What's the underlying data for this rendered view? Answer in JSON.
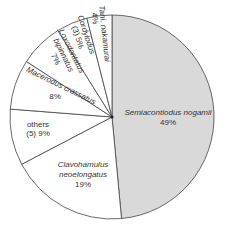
{
  "chart_data": {
    "type": "pie",
    "title": "",
    "start_angle_deg": 0,
    "direction": "clockwise",
    "center": [
      112,
      117
    ],
    "radius": 102,
    "slices": [
      {
        "label": "Semiacontiodus nogamii",
        "value": 49,
        "pct_label": "49%",
        "italic": true,
        "fill": "#d9d9d9"
      },
      {
        "label": "Clavohamulus neoelongatus",
        "value": 19,
        "pct_label": "19%",
        "italic": true,
        "fill": "#ffffff"
      },
      {
        "label": "others (5)",
        "value": 9,
        "pct_label": "9%",
        "italic": false,
        "fill": "#ffffff"
      },
      {
        "label": "Macerodus crassatus",
        "value": 8,
        "pct_label": "8%",
        "italic": true,
        "fill": "#ffffff"
      },
      {
        "label": "Loxodontatus bipinnatus",
        "value": 7,
        "pct_label": "7%",
        "italic": true,
        "fill": "#ffffff"
      },
      {
        "label": "Cordylodus (3)",
        "value": 5,
        "pct_label": "5%",
        "italic": true,
        "fill": "#ffffff"
      },
      {
        "label": "Tani. nakamurai",
        "value": 4,
        "pct_label": "4%",
        "italic": true,
        "fill": "#ffffff"
      }
    ],
    "legend": "none",
    "stroke_color": "#444444"
  },
  "labels": {
    "semiacontiodus": {
      "line1": "Semiacontiodus nogamii",
      "line2": "49%"
    },
    "clavohamulus": {
      "line1": "Clavohamulus",
      "line2": "neoelongatus",
      "line3": "19%"
    },
    "others": {
      "line1": "others",
      "line2": "(5) 9%"
    },
    "macerodus": {
      "line1": "Macerodus crassatus",
      "line2": "8%"
    },
    "loxodontatus": {
      "line1": "Loxodontatus",
      "line2": "bipinnatus",
      "line3": "7%"
    },
    "cordylodus": {
      "line1": "Cordylodus",
      "line2": "(3) 5%"
    },
    "tani": {
      "line1": "Tani. nakamurai",
      "line2": "4%"
    }
  }
}
